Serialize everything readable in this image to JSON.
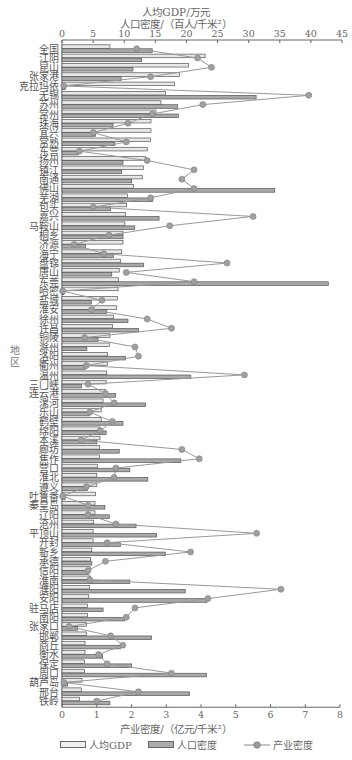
{
  "chart_data": {
    "type": "bar",
    "orientation": "horizontal",
    "title_top_line1": "人均GDP/万元",
    "title_top_line2": "人口密度/（百人/千米²）",
    "xlabel_bottom": "产业密度/（亿元/千米²）",
    "ylabel": "地区",
    "top_axis": {
      "range": [
        0,
        45
      ],
      "ticks": [
        0,
        5,
        10,
        15,
        20,
        25,
        30,
        35,
        40,
        45
      ]
    },
    "bottom_axis": {
      "range": [
        0,
        8
      ],
      "ticks": [
        0,
        1,
        2,
        3,
        4,
        5,
        6,
        7,
        8
      ]
    },
    "legend": [
      "人均GDP",
      "人口密度",
      "产业密度"
    ],
    "legend_position": "bottom",
    "grid": false,
    "categories": [
      "全国",
      "江阴",
      "昆山",
      "张家港",
      "克拉玛依",
      "无锡",
      "苏州",
      "常州",
      "珠海",
      "宜兴",
      "常熟",
      "东营",
      "扬州",
      "镇江",
      "南通",
      "佛山",
      "芜湖",
      "包头",
      "嘉兴",
      "马鞍山",
      "桐乡",
      "济源",
      "海宁",
      "盘锦",
      "唐山",
      "东莞",
      "哈密",
      "盐城",
      "淮安",
      "徐州",
      "许昌",
      "铜陵",
      "滁州",
      "洛阳",
      "衢州",
      "温州",
      "三门峡",
      "连云港",
      "漯河",
      "乐山",
      "鹤壁",
      "绵阳",
      "本溪",
      "廊坊",
      "焦作",
      "营口",
      "淮北",
      "遵义",
      "吐鲁番",
      "秦皇岛",
      "辽阳",
      "沧州",
      "平顶山",
      "开封",
      "新乡",
      "承德",
      "信阳",
      "淮南",
      "濮阳",
      "安阳",
      "驻马店",
      "南阳",
      "张家口",
      "邯郸",
      "商丘",
      "衡水",
      "保定",
      "周口",
      "葫芦岛",
      "邢台",
      "铁岭"
    ],
    "series": [
      {
        "name": "人均GDP",
        "type": "bar",
        "axis": "top",
        "color": "#e8e8e8",
        "values": [
          7.7,
          23,
          20.3,
          18.9,
          18.1,
          16.6,
          15.9,
          15.1,
          14.3,
          14.3,
          14.2,
          13.7,
          13.4,
          13.1,
          12.9,
          11.5,
          10.5,
          10.4,
          10.2,
          10.1,
          9.8,
          9.8,
          9.6,
          9.4,
          9.2,
          9.1,
          9.0,
          8.9,
          8.8,
          8.3,
          8.1,
          7.7,
          7.6,
          7.3,
          7.3,
          7.2,
          7.1,
          7.0,
          6.6,
          6.3,
          6.3,
          6.1,
          6.1,
          6.0,
          6.0,
          5.7,
          5.6,
          5.6,
          5.4,
          5.3,
          5.3,
          5.1,
          5.0,
          5.0,
          4.8,
          4.6,
          4.6,
          4.6,
          4.4,
          4.3,
          4.1,
          4.1,
          3.9,
          3.9,
          3.7,
          3.7,
          3.6,
          3.6,
          3.2,
          3.1,
          2.8
        ]
      },
      {
        "name": "人口密度",
        "type": "bar",
        "axis": "top",
        "color": "#a9a9a9",
        "values": [
          14.5,
          12.8,
          11.4,
          9.5,
          0.5,
          31.2,
          18.6,
          18.7,
          8.2,
          5.4,
          8.5,
          2.6,
          9.8,
          9.6,
          11.2,
          34.2,
          14.6,
          7.8,
          15.6,
          11.7,
          9.8,
          3.8,
          8.3,
          13.1,
          8.0,
          42.8,
          0.3,
          4.7,
          7.2,
          10.6,
          12.3,
          5.8,
          4.0,
          10.2,
          3.8,
          20.7,
          3.1,
          8.6,
          13.4,
          4.4,
          9.8,
          7.1,
          5.6,
          9.2,
          19.1,
          10.9,
          13.8,
          4.1,
          0.5,
          6.9,
          7.6,
          11.9,
          15.2,
          9.4,
          16.6,
          4.8,
          4.2,
          10.9,
          19.8,
          23.3,
          6.6,
          10.1,
          2.5,
          14.4,
          9.4,
          6.5,
          11.2,
          23.2,
          0.9,
          20.5,
          7.7
        ]
      },
      {
        "name": "产业密度",
        "type": "line",
        "axis": "bottom",
        "color": "#8c8c8c",
        "values": [
          2.15,
          3.9,
          4.3,
          2.55,
          0.05,
          7.1,
          4.05,
          2.6,
          1.9,
          0.9,
          1.85,
          0.5,
          2.45,
          3.8,
          3.45,
          3.8,
          2.55,
          0.9,
          5.5,
          3.1,
          1.35,
          0.35,
          1.2,
          4.75,
          1.85,
          3.8,
          0.02,
          1.15,
          0.85,
          2.45,
          3.15,
          0.65,
          2.1,
          2.2,
          0.7,
          5.25,
          0.75,
          1.25,
          1.5,
          0.8,
          1.45,
          1.1,
          0.55,
          3.45,
          3.95,
          1.55,
          1.5,
          0.7,
          0.02,
          0.75,
          0.75,
          1.55,
          5.6,
          1.3,
          3.7,
          1.25,
          0.75,
          0.8,
          6.3,
          4.2,
          2.1,
          1.85,
          0.2,
          1.4,
          1.75,
          1.05,
          1.3,
          3.15,
          0.05,
          2.2,
          1.0
        ]
      }
    ]
  },
  "layout": {
    "plot_left": 62,
    "plot_right": 342,
    "bottom_right": 340,
    "first_row_y": 44.5,
    "row_height": 9.32
  }
}
